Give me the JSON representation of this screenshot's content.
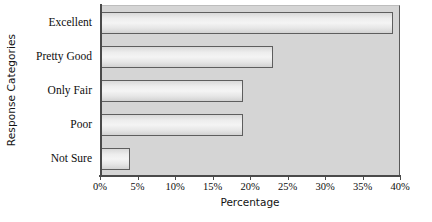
{
  "chart_data": {
    "type": "bar",
    "orientation": "horizontal",
    "title": "",
    "xlabel": "Percentage",
    "ylabel": "Response Categories",
    "categories": [
      "Excellent",
      "Pretty Good",
      "Only Fair",
      "Poor",
      "Not Sure"
    ],
    "values": [
      39,
      23,
      19,
      19,
      4
    ],
    "xlim": [
      0,
      40
    ],
    "xticks": [
      0,
      5,
      10,
      15,
      20,
      25,
      30,
      35,
      40
    ],
    "xtick_labels": [
      "0%",
      "5%",
      "10%",
      "15%",
      "20%",
      "25%",
      "30%",
      "35%",
      "40%"
    ],
    "grid": false,
    "legend": false,
    "plot_background_color": "#d5d5d5",
    "bar_border_color": "#5e5e5e",
    "bar_fill_color": "#eeeeee"
  }
}
